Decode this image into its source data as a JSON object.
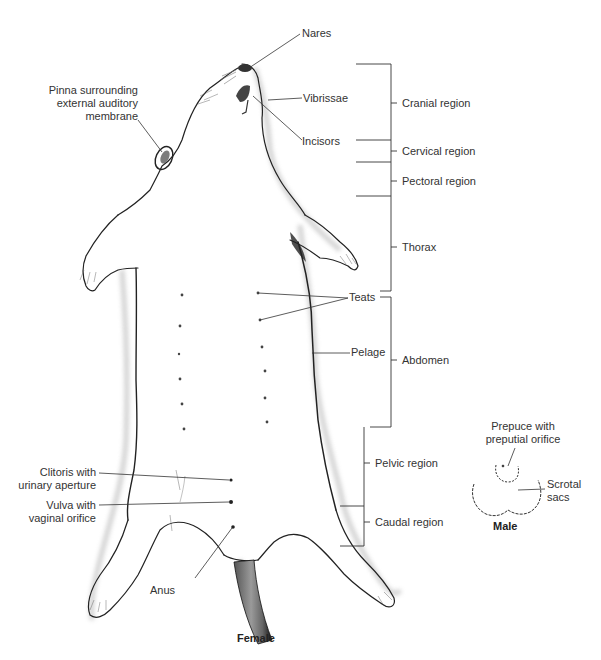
{
  "figure": {
    "title_female": "Female",
    "title_male": "Male"
  },
  "labels": {
    "nares": "Nares",
    "vibrissae": "Vibrissae",
    "incisors": "Incisors",
    "pinna_line1": "Pinna surrounding",
    "pinna_line2": "external auditory",
    "pinna_line3": "membrane",
    "teats": "Teats",
    "pelage": "Pelage",
    "clitoris_line1": "Clitoris with",
    "clitoris_line2": "urinary aperture",
    "vulva_line1": "Vulva with",
    "vulva_line2": "vaginal orifice",
    "anus": "Anus",
    "prepuce_line1": "Prepuce with",
    "prepuce_line2": "preputial orifice",
    "scrotal_line1": "Scrotal",
    "scrotal_line2": "sacs"
  },
  "regions": [
    {
      "label": "Cranial region"
    },
    {
      "label": "Cervical region"
    },
    {
      "label": "Pectoral region"
    },
    {
      "label": "Thorax"
    },
    {
      "label": "Abdomen"
    },
    {
      "label": "Pelvic region"
    },
    {
      "label": "Caudal region"
    }
  ],
  "colors": {
    "line": "#333333",
    "outline": "#222222",
    "shadow": "#bbbbbb",
    "tail_dark": "#3a3a3a",
    "tail_mid": "#888888"
  }
}
